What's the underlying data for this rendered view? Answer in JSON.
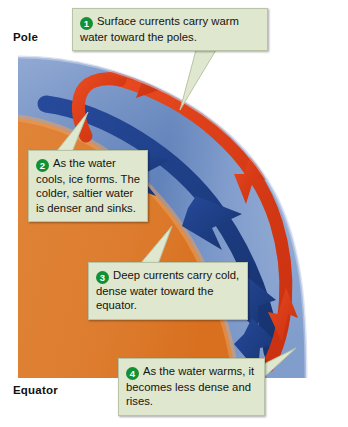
{
  "figure": {
    "labels": {
      "pole": "Pole",
      "equator": "Equator"
    },
    "colors": {
      "ocean_light": "#9fb4d8",
      "ocean_mid": "#6f8ec0",
      "ocean_deep": "#3f63a5",
      "land_orange": "#e08438",
      "surface_current_red": "#d93a18",
      "deep_current_blue": "#1c3f86",
      "callout_background": "#dfe7cf",
      "callout_border": "#b9c4a6",
      "badge_green": "#119136",
      "text": "#17130e"
    },
    "callouts": [
      {
        "number": "1",
        "text": "Surface currents carry warm water toward the poles."
      },
      {
        "number": "2",
        "text": "As the water cools, ice forms. The colder, saltier water is denser and sinks."
      },
      {
        "number": "3",
        "text": "Deep currents carry cold, dense water toward the equator."
      },
      {
        "number": "4",
        "text": "As the water warms, it becomes less dense and rises."
      }
    ]
  }
}
